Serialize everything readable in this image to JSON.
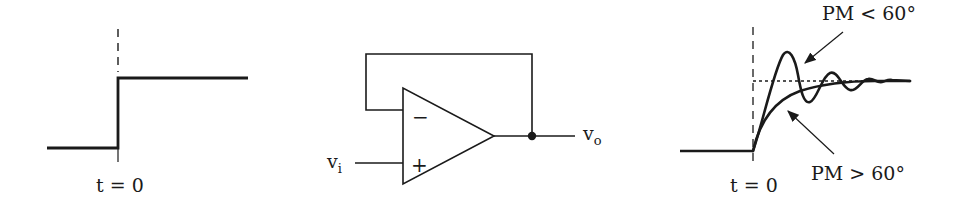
{
  "figure": {
    "panels": [
      {
        "id": "step-input",
        "description": "Step input signal",
        "time_label": "t = 0"
      },
      {
        "id": "voltage-follower",
        "description": "Op-amp unity-gain buffer (voltage follower)",
        "input_label": "v",
        "input_subscript": "i",
        "output_label": "v",
        "output_subscript": "o",
        "inverting_symbol": "−",
        "noninverting_symbol": "+"
      },
      {
        "id": "step-response",
        "description": "Step response vs phase margin",
        "time_label": "t = 0",
        "curves": [
          {
            "label": "PM < 60°",
            "behavior": "underdamped, ringing overshoot"
          },
          {
            "label": "PM > 60°",
            "behavior": "overdamped, smooth rise"
          }
        ]
      }
    ]
  },
  "colors": {
    "stroke": "#1a1a1a",
    "background": "#ffffff"
  }
}
